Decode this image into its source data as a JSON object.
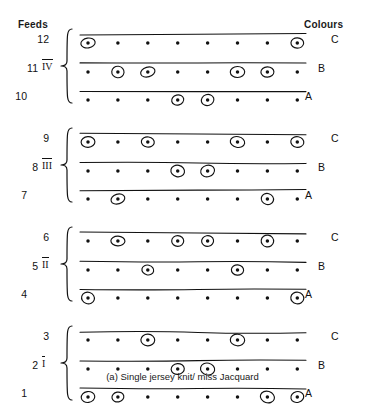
{
  "headers": {
    "left": "Feeds",
    "right": "Colours"
  },
  "caption": "(a) Single jersey knit/ miss Jacquard",
  "columns": 8,
  "colors": {
    "ink": "#111111",
    "background": "#ffffff"
  },
  "groups": [
    {
      "roman": "IV",
      "rows": [
        12,
        11,
        10
      ]
    },
    {
      "roman": "III",
      "rows": [
        9,
        8,
        7
      ]
    },
    {
      "roman": "II",
      "rows": [
        6,
        5,
        4
      ]
    },
    {
      "roman": "I",
      "rows": [
        3,
        2,
        1
      ]
    }
  ],
  "rows": [
    {
      "feed": "12",
      "colour": "C",
      "knit_positions": [
        1,
        8
      ],
      "miss_positions": [
        2,
        3,
        4,
        5,
        6,
        7
      ]
    },
    {
      "feed": "11",
      "colour": "B",
      "knit_positions": [
        2,
        3,
        6,
        7
      ],
      "miss_positions": [
        1,
        4,
        5,
        8
      ]
    },
    {
      "feed": "10",
      "colour": "A",
      "knit_positions": [
        4,
        5
      ],
      "miss_positions": [
        1,
        2,
        3,
        6,
        7,
        8
      ]
    },
    {
      "feed": "9",
      "colour": "C",
      "knit_positions": [
        1,
        3,
        6,
        8
      ],
      "miss_positions": [
        2,
        4,
        5,
        7
      ]
    },
    {
      "feed": "8",
      "colour": "B",
      "knit_positions": [
        4,
        5
      ],
      "miss_positions": [
        1,
        2,
        3,
        6,
        7,
        8
      ]
    },
    {
      "feed": "7",
      "colour": "A",
      "knit_positions": [
        2,
        7
      ],
      "miss_positions": [
        1,
        3,
        4,
        5,
        6,
        8
      ]
    },
    {
      "feed": "6",
      "colour": "C",
      "knit_positions": [
        2,
        4,
        5,
        7
      ],
      "miss_positions": [
        1,
        3,
        6,
        8
      ]
    },
    {
      "feed": "5",
      "colour": "B",
      "knit_positions": [
        3,
        6
      ],
      "miss_positions": [
        1,
        2,
        4,
        5,
        7,
        8
      ]
    },
    {
      "feed": "4",
      "colour": "A",
      "knit_positions": [
        1,
        8
      ],
      "miss_positions": [
        2,
        3,
        4,
        5,
        6,
        7
      ]
    },
    {
      "feed": "3",
      "colour": "C",
      "knit_positions": [
        3,
        6
      ],
      "miss_positions": [
        1,
        2,
        4,
        5,
        7,
        8
      ]
    },
    {
      "feed": "2",
      "colour": "B",
      "knit_positions": [
        4,
        5
      ],
      "miss_positions": [
        1,
        2,
        3,
        6,
        7,
        8
      ]
    },
    {
      "feed": "1",
      "colour": "A",
      "knit_positions": [
        1,
        2,
        7,
        8
      ],
      "miss_positions": [
        3,
        4,
        5,
        6
      ]
    }
  ],
  "legend": {
    "knit_symbol": "circled-dot",
    "miss_symbol": "dot"
  }
}
